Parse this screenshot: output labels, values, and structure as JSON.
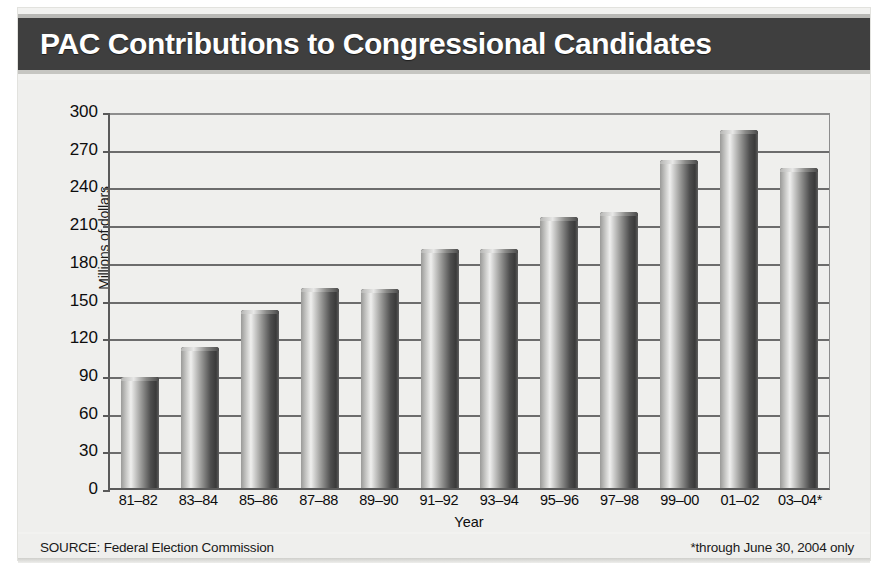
{
  "title": "PAC Contributions to Congressional Candidates",
  "footer": {
    "source": "SOURCE: Federal Election Commission",
    "note": "*through June 30, 2004 only"
  },
  "chart_data": {
    "type": "bar",
    "title": "PAC Contributions to Congressional Candidates",
    "xlabel": "Year",
    "ylabel": "Millions of dollars",
    "ylim": [
      0,
      300
    ],
    "yticks": [
      0,
      30,
      60,
      90,
      120,
      150,
      180,
      210,
      240,
      270,
      300
    ],
    "grid": true,
    "legend": "none",
    "categories": [
      "81–82",
      "83–84",
      "85–86",
      "87–88",
      "89–90",
      "91–92",
      "93–94",
      "95–96",
      "97–98",
      "99–00",
      "01–02",
      "03–04*"
    ],
    "values": [
      88,
      112,
      142,
      159,
      158,
      190,
      190,
      216,
      220,
      261,
      285,
      255
    ],
    "units": "millions of dollars"
  },
  "colors": {
    "title_band": "#3f3f3f",
    "title_text": "#ffffff",
    "panel": "#efefed",
    "bar_light": "#efefee",
    "bar_dark": "#3a3a3a",
    "gridline": "#6c6c6c",
    "axis": "#5a5a5a"
  }
}
